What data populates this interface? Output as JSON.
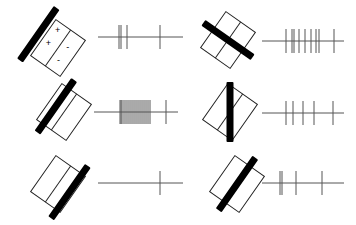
{
  "diagram": {
    "colors": {
      "background": "#ffffff",
      "outline": "#222222",
      "bar": "#000000",
      "spike_line": "#555555"
    },
    "receptive_field_signs": {
      "plus": "+",
      "minus": "-"
    },
    "panels": [
      {
        "id": "top-left",
        "rf_center": [
          58,
          48
        ],
        "rf_angle": 35,
        "bar_offset": -24,
        "bar_angle": 35,
        "show_signs": true,
        "train": {
          "x1": 98,
          "x2": 183,
          "y": 37,
          "spikes": [
            119,
            121,
            127,
            160
          ]
        }
      },
      {
        "id": "top-right",
        "rf_center": [
          228,
          40
        ],
        "rf_angle": 35,
        "bar_offset": 0,
        "bar_angle": -55,
        "show_signs": false,
        "train": {
          "x1": 262,
          "x2": 344,
          "y": 41,
          "spikes": [
            286,
            292,
            294,
            299,
            305,
            311,
            316,
            319,
            334
          ]
        }
      },
      {
        "id": "middle-left",
        "rf_center": [
          64,
          112
        ],
        "rf_angle": 35,
        "bar_offset": -10,
        "bar_angle": 35,
        "show_signs": false,
        "train": {
          "x1": 94,
          "x2": 178,
          "y": 112,
          "spikes": [
            120,
            121,
            122,
            124,
            126,
            128,
            130,
            132,
            134,
            136,
            138,
            140,
            142,
            144,
            146,
            148,
            150,
            166
          ]
        }
      },
      {
        "id": "middle-right",
        "rf_center": [
          230,
          112
        ],
        "rf_angle": 35,
        "bar_offset": 0,
        "bar_angle": 0,
        "show_signs": false,
        "train": {
          "x1": 262,
          "x2": 344,
          "y": 113,
          "spikes": [
            286,
            293,
            303,
            314,
            333
          ]
        }
      },
      {
        "id": "bottom-left",
        "rf_center": [
          58,
          184
        ],
        "rf_angle": 35,
        "bar_offset": 14,
        "bar_angle": 35,
        "show_signs": false,
        "train": {
          "x1": 98,
          "x2": 183,
          "y": 183,
          "spikes": [
            160
          ]
        }
      },
      {
        "id": "bottom-right",
        "rf_center": [
          237,
          184
        ],
        "rf_angle": 35,
        "bar_offset": 0,
        "bar_angle": 35,
        "show_signs": false,
        "train": {
          "x1": 262,
          "x2": 344,
          "y": 183,
          "spikes": [
            280,
            282,
            296,
            322
          ]
        }
      }
    ]
  }
}
